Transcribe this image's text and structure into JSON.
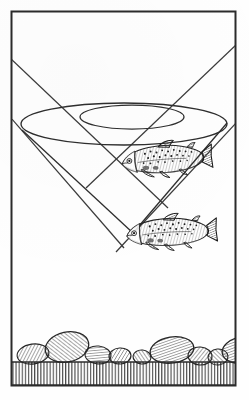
{
  "figure": {
    "caption": "",
    "style": "pen-and-ink line drawing",
    "ink_color": "#2b2b2b",
    "paper_color": "#fefefe",
    "frame": {
      "x": 11,
      "y": 11,
      "width": 225,
      "height": 375,
      "stroke_width": 2
    }
  },
  "elements": {
    "water_surface_outer_ellipse": {
      "name": "surface-window-outer-ellipse",
      "cx": 124,
      "cy": 124,
      "rx": 103,
      "ry": 21
    },
    "water_surface_inner_ellipse": {
      "name": "surface-window-inner-ellipse",
      "cx": 132,
      "cy": 117,
      "rx": 52,
      "ry": 12
    },
    "cone_left_edge": {
      "name": "cone-left-edge",
      "x1": 22,
      "y1": 131,
      "x2": 133,
      "y2": 232
    },
    "cone_right_edge": {
      "name": "cone-right-edge",
      "x1": 227,
      "y1": 124,
      "x2": 133,
      "y2": 232
    },
    "sight_line_upper_left": {
      "name": "sight-line-upper-left",
      "x1": 11,
      "y1": 59,
      "x2": 160,
      "y2": 200
    },
    "sight_line_upper_right": {
      "name": "sight-line-upper-right",
      "x1": 236,
      "y1": 45,
      "x2": 95,
      "y2": 180
    },
    "sight_line_lower_left": {
      "name": "sight-line-lower-left",
      "x1": 11,
      "y1": 118,
      "x2": 118,
      "y2": 240
    },
    "sight_line_lower_right": {
      "name": "sight-line-lower-right",
      "x1": 236,
      "y1": 123,
      "x2": 120,
      "y2": 242
    },
    "upper_fish": {
      "name": "upper-trout",
      "cx": 163,
      "cy": 162,
      "length": 95,
      "facing": "left"
    },
    "lower_fish": {
      "name": "lower-trout",
      "cx": 168,
      "cy": 235,
      "length": 95,
      "facing": "left"
    },
    "streambed_line_y": 362,
    "gravel_band": {
      "name": "gravel-band",
      "top": 362,
      "bottom": 385
    }
  },
  "rocks": [
    {
      "cx": 33,
      "cy": 354,
      "rx": 16,
      "ry": 10,
      "rot": -8
    },
    {
      "cx": 67,
      "cy": 347,
      "rx": 22,
      "ry": 15,
      "rot": -12
    },
    {
      "cx": 98,
      "cy": 355,
      "rx": 13,
      "ry": 9,
      "rot": 5
    },
    {
      "cx": 120,
      "cy": 356,
      "rx": 11,
      "ry": 8,
      "rot": -4
    },
    {
      "cx": 142,
      "cy": 357,
      "rx": 9,
      "ry": 7,
      "rot": 6
    },
    {
      "cx": 172,
      "cy": 350,
      "rx": 22,
      "ry": 13,
      "rot": -9
    },
    {
      "cx": 200,
      "cy": 356,
      "rx": 12,
      "ry": 9,
      "rot": 4
    },
    {
      "cx": 218,
      "cy": 357,
      "rx": 10,
      "ry": 8,
      "rot": -6
    },
    {
      "cx": 242,
      "cy": 350,
      "rx": 20,
      "ry": 13,
      "rot": -10
    },
    {
      "cx": 268,
      "cy": 356,
      "rx": 11,
      "ry": 8,
      "rot": 3
    },
    {
      "cx": 288,
      "cy": 353,
      "rx": 9,
      "ry": 7,
      "rot": -5
    }
  ],
  "labels": {
    "none_visible": ""
  }
}
